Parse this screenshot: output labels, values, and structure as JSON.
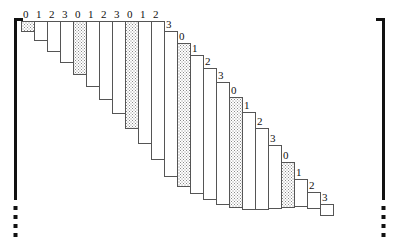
{
  "figure": {
    "type": "staircase-nested-rectangles-diagram",
    "title": "",
    "canvas": {
      "width": 399,
      "height": 245
    },
    "colors": {
      "outline": "#555555",
      "shaded_fill": "#d8d8d8",
      "plain_fill": "#ffffff",
      "bracket": "#111111",
      "label_text": "#111111"
    },
    "label_cycle": [
      "0",
      "1",
      "2",
      "3"
    ],
    "shaded_label": "0",
    "bars": [
      {
        "label": "0",
        "shaded": true,
        "x": 21,
        "y": 21,
        "w": 13,
        "h": 10
      },
      {
        "label": "1",
        "shaded": false,
        "x": 34,
        "y": 21,
        "w": 13,
        "h": 19
      },
      {
        "label": "2",
        "shaded": false,
        "x": 47,
        "y": 21,
        "w": 13,
        "h": 30
      },
      {
        "label": "3",
        "shaded": false,
        "x": 60,
        "y": 21,
        "w": 13,
        "h": 41
      },
      {
        "label": "0",
        "shaded": true,
        "x": 73,
        "y": 21,
        "w": 13,
        "h": 53
      },
      {
        "label": "1",
        "shaded": false,
        "x": 86,
        "y": 21,
        "w": 13,
        "h": 65
      },
      {
        "label": "2",
        "shaded": false,
        "x": 99,
        "y": 21,
        "w": 13,
        "h": 78
      },
      {
        "label": "3",
        "shaded": false,
        "x": 112,
        "y": 21,
        "w": 13,
        "h": 92
      },
      {
        "label": "0",
        "shaded": true,
        "x": 125,
        "y": 21,
        "w": 13,
        "h": 107
      },
      {
        "label": "1",
        "shaded": false,
        "x": 138,
        "y": 21,
        "w": 13,
        "h": 122
      },
      {
        "label": "2",
        "shaded": false,
        "x": 151,
        "y": 21,
        "w": 13,
        "h": 138
      },
      {
        "label": "3",
        "shaded": false,
        "x": 164,
        "y": 31,
        "w": 13,
        "h": 145
      },
      {
        "label": "0",
        "shaded": true,
        "x": 177,
        "y": 43,
        "w": 13,
        "h": 143
      },
      {
        "label": "1",
        "shaded": false,
        "x": 190,
        "y": 55,
        "w": 13,
        "h": 138
      },
      {
        "label": "2",
        "shaded": false,
        "x": 203,
        "y": 68,
        "w": 13,
        "h": 131
      },
      {
        "label": "3",
        "shaded": false,
        "x": 216,
        "y": 82,
        "w": 13,
        "h": 122
      },
      {
        "label": "0",
        "shaded": true,
        "x": 229,
        "y": 97,
        "w": 13,
        "h": 110
      },
      {
        "label": "1",
        "shaded": false,
        "x": 242,
        "y": 112,
        "w": 13,
        "h": 97
      },
      {
        "label": "2",
        "shaded": false,
        "x": 255,
        "y": 128,
        "w": 13,
        "h": 81
      },
      {
        "label": "3",
        "shaded": false,
        "x": 268,
        "y": 145,
        "w": 13,
        "h": 63
      },
      {
        "label": "0",
        "shaded": true,
        "x": 281,
        "y": 162,
        "w": 13,
        "h": 45
      },
      {
        "label": "1",
        "shaded": false,
        "x": 294,
        "y": 179,
        "w": 13,
        "h": 27
      },
      {
        "label": "2",
        "shaded": false,
        "x": 307,
        "y": 192,
        "w": 13,
        "h": 16
      },
      {
        "label": "3",
        "shaded": false,
        "x": 320,
        "y": 204,
        "w": 13,
        "h": 11
      }
    ],
    "left_bracket": {
      "x": 14,
      "top": 18,
      "bottom": 200,
      "serif_len": 9,
      "dots": 4
    },
    "right_bracket": {
      "x": 382,
      "top": 18,
      "bottom": 200,
      "serif_len": 9,
      "dots": 4
    }
  }
}
